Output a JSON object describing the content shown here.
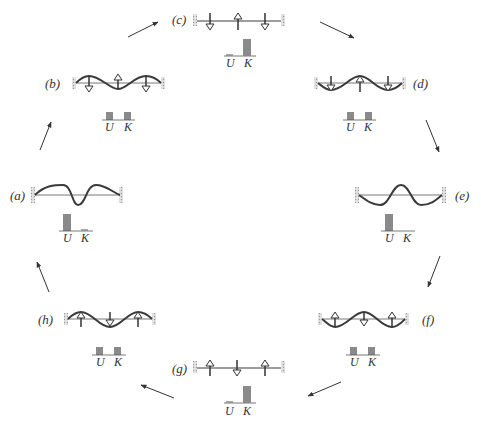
{
  "diagram": {
    "colors": {
      "string": "#3a3a3a",
      "axis": "#555555",
      "bar": "#8a8a8a",
      "arrow": "#333333",
      "wall": "#aaaaaa"
    },
    "axis_labels": {
      "u": "U",
      "k": "K"
    },
    "panels": [
      {
        "id": "a",
        "label": "(a)",
        "shape": "max-positive",
        "velocity_arrows": "none",
        "U": 1.0,
        "K": 0.0
      },
      {
        "id": "b",
        "label": "(b)",
        "shape": "half-positive",
        "velocity_arrows": "down-up-down",
        "U": 0.5,
        "K": 0.5
      },
      {
        "id": "c",
        "label": "(c)",
        "shape": "flat",
        "velocity_arrows": "down-up-down",
        "U": 0.0,
        "K": 1.0
      },
      {
        "id": "d",
        "label": "(d)",
        "shape": "half-negative",
        "velocity_arrows": "down-up-down",
        "U": 0.5,
        "K": 0.5
      },
      {
        "id": "e",
        "label": "(e)",
        "shape": "max-negative",
        "velocity_arrows": "none",
        "U": 1.0,
        "K": 0.0
      },
      {
        "id": "f",
        "label": "(f)",
        "shape": "half-negative",
        "velocity_arrows": "up-down-up",
        "U": 0.5,
        "K": 0.5
      },
      {
        "id": "g",
        "label": "(g)",
        "shape": "flat",
        "velocity_arrows": "up-down-up",
        "U": 0.0,
        "K": 1.0
      },
      {
        "id": "h",
        "label": "(h)",
        "shape": "half-positive",
        "velocity_arrows": "up-down-up",
        "U": 0.5,
        "K": 0.5
      }
    ],
    "cycle_order": [
      "a",
      "b",
      "c",
      "d",
      "e",
      "f",
      "g",
      "h",
      "a"
    ]
  }
}
